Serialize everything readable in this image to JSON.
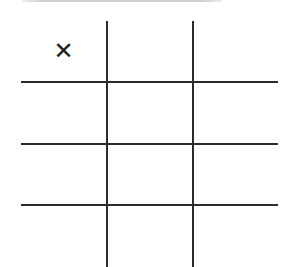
{
  "game": {
    "type": "tic-tac-toe",
    "rows": 4,
    "cols": 3,
    "cells": [
      [
        "X",
        "",
        ""
      ],
      [
        "",
        "",
        ""
      ],
      [
        "",
        "",
        ""
      ],
      [
        "",
        "",
        ""
      ]
    ]
  },
  "colors": {
    "line": "#2b2b2b",
    "mark": "#222222",
    "top_bar": "#cfcfcf",
    "background": "#ffffff"
  }
}
